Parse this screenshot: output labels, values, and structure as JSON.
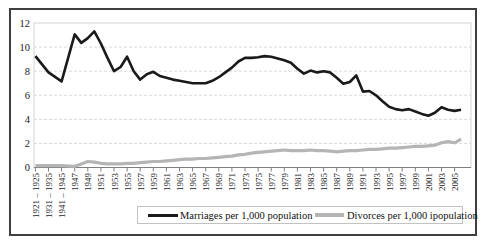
{
  "chart_data": {
    "type": "line",
    "title": "",
    "grid": "horizontal-dashed",
    "legend_position": "bottom",
    "colors": {
      "marriages_line": "#1a1a1a",
      "divorces_line": "#b5b5b5",
      "gridline": "#d9d9d9",
      "plot_border": "#d4d4d4",
      "axis": "#7f7f7f",
      "outer_border": "#3f3f3f",
      "text": "#1a1a1a"
    },
    "y_axis": {
      "min": 0,
      "max": 12,
      "step": 2,
      "tick_labels": [
        "0",
        "2",
        "4",
        "6",
        "8",
        "10",
        "12"
      ]
    },
    "x_axis": {
      "period_labels": [
        "1921 – 1925",
        "1931 – 1935",
        "1941 – 1945"
      ],
      "annual_start": 1947,
      "annual_end": 2006,
      "tick_labels": [
        "1921 – 1925",
        "1931 – 1935",
        "1941 – 1945",
        "1947",
        "1949",
        "1951",
        "1953",
        "1955",
        "1957",
        "1959",
        "1961",
        "1963",
        "1965",
        "1967",
        "1969",
        "1971",
        "1973",
        "1975",
        "1977",
        "1979",
        "1981",
        "1983",
        "1985",
        "1987",
        "1989",
        "1991",
        "1993",
        "1995",
        "1997",
        "1999",
        "2001",
        "2003",
        "2005"
      ]
    },
    "series": [
      {
        "name": "Marriages per 1,000 population",
        "color": "#1a1a1a",
        "values": [
          9.25,
          7.9,
          7.15,
          11.05,
          10.35,
          10.75,
          11.3,
          10.3,
          9.1,
          8.0,
          8.35,
          9.2,
          8.0,
          7.3,
          7.75,
          7.95,
          7.6,
          7.45,
          7.3,
          7.2,
          7.1,
          7.0,
          7.0,
          7.0,
          7.2,
          7.5,
          7.9,
          8.3,
          8.8,
          9.1,
          9.1,
          9.15,
          9.25,
          9.2,
          9.05,
          8.9,
          8.7,
          8.2,
          7.8,
          8.05,
          7.9,
          8.0,
          7.9,
          7.45,
          6.95,
          7.1,
          7.65,
          6.3,
          6.35,
          6.0,
          5.5,
          5.05,
          4.85,
          4.75,
          4.85,
          4.65,
          4.45,
          4.3,
          4.55,
          5.0,
          4.8,
          4.7,
          4.8
        ]
      },
      {
        "name": "Divorces per 1,000 ipopulation",
        "color": "#b5b5b5",
        "values": [
          0.15,
          0.15,
          0.15,
          0.1,
          0.3,
          0.5,
          0.45,
          0.35,
          0.3,
          0.3,
          0.3,
          0.35,
          0.35,
          0.4,
          0.45,
          0.5,
          0.5,
          0.55,
          0.6,
          0.65,
          0.7,
          0.7,
          0.75,
          0.75,
          0.8,
          0.85,
          0.9,
          0.95,
          1.05,
          1.1,
          1.2,
          1.25,
          1.3,
          1.35,
          1.4,
          1.45,
          1.4,
          1.4,
          1.4,
          1.45,
          1.4,
          1.4,
          1.35,
          1.3,
          1.35,
          1.4,
          1.4,
          1.45,
          1.5,
          1.5,
          1.55,
          1.6,
          1.6,
          1.65,
          1.7,
          1.75,
          1.75,
          1.8,
          1.85,
          2.05,
          2.15,
          2.05,
          2.35
        ]
      }
    ]
  }
}
